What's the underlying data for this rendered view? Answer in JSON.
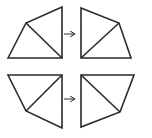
{
  "diagram": {
    "colors": {
      "stroke": "#2a2a2a",
      "background": "#ffffff"
    },
    "rows": [
      {
        "before": {
          "outline": [
            [
              8,
              58
            ],
            [
              26,
              23
            ],
            [
              62,
              7
            ],
            [
              62,
              58
            ]
          ],
          "diagonal": [
            [
              26,
              23
            ],
            [
              62,
              58
            ]
          ]
        },
        "arrow": {
          "from": [
            64,
            34
          ],
          "to": [
            75,
            34
          ]
        },
        "after": {
          "outline": [
            [
              81,
              8
            ],
            [
              119,
              23
            ],
            [
              131,
              58
            ],
            [
              81,
              58
            ]
          ],
          "diagonal": [
            [
              81,
              58
            ],
            [
              119,
              23
            ]
          ]
        }
      },
      {
        "before": {
          "outline": [
            [
              8,
              75
            ],
            [
              62,
              75
            ],
            [
              62,
              128
            ],
            [
              26,
              111
            ]
          ],
          "diagonal": [
            [
              26,
              111
            ],
            [
              62,
              75
            ]
          ]
        },
        "arrow": {
          "from": [
            64,
            99
          ],
          "to": [
            75,
            99
          ]
        },
        "after": {
          "outline": [
            [
              81,
              75
            ],
            [
              134,
              75
            ],
            [
              120,
              112
            ],
            [
              81,
              127
            ]
          ],
          "diagonal": [
            [
              81,
              75
            ],
            [
              120,
              112
            ]
          ]
        }
      }
    ]
  }
}
